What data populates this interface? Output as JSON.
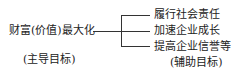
{
  "diagram": {
    "main_goal": {
      "label": "财富(价值)最大化",
      "note": "(主导目标)"
    },
    "sub_goals": [
      {
        "label": "履行社会责任"
      },
      {
        "label": "加速企业成长"
      },
      {
        "label": "提高企业信誉等"
      }
    ],
    "sub_note": "(辅助目标)",
    "line_color": "#333333"
  }
}
